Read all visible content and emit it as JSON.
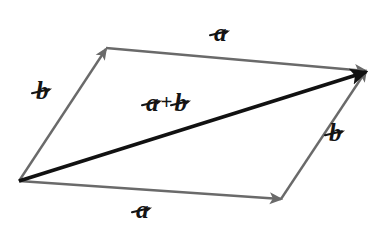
{
  "figure": {
    "background_color": "#ffffff",
    "width": 384,
    "height": 235
  },
  "colors": {
    "component_vector": "#6a6a6a",
    "resultant_vector": "#111111",
    "label_text": "#141414",
    "background": "#ffffff"
  },
  "labels": {
    "a_top": {
      "base": "a",
      "accent": "→",
      "full": "a⃗"
    },
    "b_left": {
      "base": "b",
      "accent": "→",
      "full": "b⃗"
    },
    "b_right": {
      "base": "b",
      "accent": "→",
      "full": "b⃗"
    },
    "a_bottom": {
      "base": "a",
      "accent": "→",
      "full": "a⃗"
    },
    "sum": {
      "first_base": "a",
      "first_accent": "→",
      "operator": "+",
      "second_base": "b",
      "second_accent": "→",
      "full": "a⃗ + b⃗"
    }
  },
  "geometry": {
    "origin": {
      "x": 19,
      "y": 181
    },
    "tip_b_left": {
      "x": 106,
      "y": 49
    },
    "tip_a_bottom": {
      "x": 281,
      "y": 199
    },
    "resultant_tip": {
      "x": 366,
      "y": 71
    },
    "edges": [
      {
        "name": "b-left",
        "from": "origin",
        "to": "tip_b_left",
        "label": "b_left",
        "style": "gray-arrow"
      },
      {
        "name": "a-top",
        "from": "tip_b_left",
        "to": "resultant_tip",
        "label": "a_top",
        "style": "gray-arrow"
      },
      {
        "name": "a-bottom",
        "from": "origin",
        "to": "tip_a_bottom",
        "label": "a_bottom",
        "style": "gray-arrow"
      },
      {
        "name": "b-right",
        "from": "tip_a_bottom",
        "to": "resultant_tip",
        "label": "b_right",
        "style": "gray-arrow"
      },
      {
        "name": "resultant",
        "from": "origin",
        "to": "resultant_tip",
        "label": "sum",
        "style": "black-arrow"
      }
    ]
  }
}
